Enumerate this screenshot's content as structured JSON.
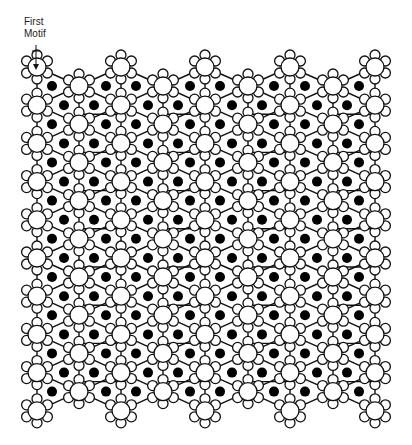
{
  "annotation": {
    "line1": "First",
    "line2": "Motif",
    "arrow_from": [
      36,
      45
    ],
    "arrow_to": [
      36,
      70
    ]
  },
  "colors": {
    "stroke": "#111111",
    "fill": "#ffffff",
    "dot": "#000000"
  },
  "grid": {
    "a_columns_x": [
      37,
      121,
      205,
      290,
      375
    ],
    "b_columns_x": [
      79,
      163,
      248,
      333
    ],
    "a_row_start_y": 67,
    "b_row_start_y": 86,
    "row_step": 38.2,
    "a_rows": 10,
    "b_rows": 9,
    "b_rows_first_row_index": 0
  },
  "flower": {
    "center_radius": 9,
    "petal_radius": 5,
    "petal_distance": 12,
    "petal_count": 6
  },
  "dots": {
    "radius": 5,
    "b_level_offsets_x": [
      15,
      69
    ],
    "a_level_offsets_x": [
      27,
      57
    ]
  }
}
